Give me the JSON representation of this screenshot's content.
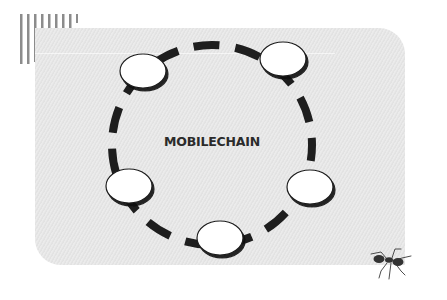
{
  "diagram": {
    "title": "MOBILECHAIN",
    "type": "cycle",
    "node_count": 5,
    "nodes": [
      {
        "id": "node-top-left",
        "label": "",
        "cx": 143,
        "cy": 71
      },
      {
        "id": "node-top-right",
        "label": "",
        "cx": 283,
        "cy": 59
      },
      {
        "id": "node-right",
        "label": "",
        "cx": 310,
        "cy": 187
      },
      {
        "id": "node-bottom",
        "label": "",
        "cx": 220,
        "cy": 238
      },
      {
        "id": "node-left",
        "label": "",
        "cx": 129,
        "cy": 186
      }
    ],
    "ring": {
      "cx": 212,
      "cy": 145,
      "r": 100,
      "style": "dashed"
    }
  },
  "decorations": {
    "stripes": "vertical-stripes-top-left",
    "ant": "ant-illustration-bottom-right"
  },
  "colors": {
    "panel": "#e7e7e7",
    "ring": "#1e1e1e",
    "node_fill": "#ffffff",
    "node_stroke": "#1e1e1e",
    "text": "#2b2b2b",
    "stripes": "#8a8a8a"
  }
}
